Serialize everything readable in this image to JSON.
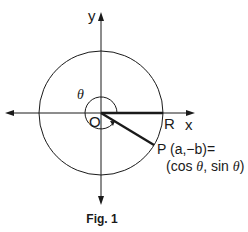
{
  "figure": {
    "caption": "Fig. 1",
    "axis_labels": {
      "x": "x",
      "y": "y"
    },
    "points": {
      "origin": "O",
      "R": "R",
      "P_line1": "P (a,−b)=",
      "P_line2_pre": "(cos ",
      "P_line2_mid": ", sin ",
      "P_line2_post": ")"
    },
    "angle_label": "θ",
    "theta_symbol": "θ",
    "colors": {
      "stroke": "#1a1a1a",
      "background": "#ffffff"
    }
  }
}
